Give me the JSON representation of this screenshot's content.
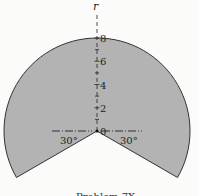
{
  "diagram": {
    "axis_label": "r",
    "r_max": 8,
    "tick_labels": [
      "0",
      "2",
      "4",
      "6",
      "8"
    ],
    "minor_ticks": [
      1,
      3,
      5,
      7
    ],
    "cut_angle_left": "30°",
    "cut_angle_right": "30°",
    "region_color": "#b3b3b3",
    "caption": "Problem 7X"
  }
}
